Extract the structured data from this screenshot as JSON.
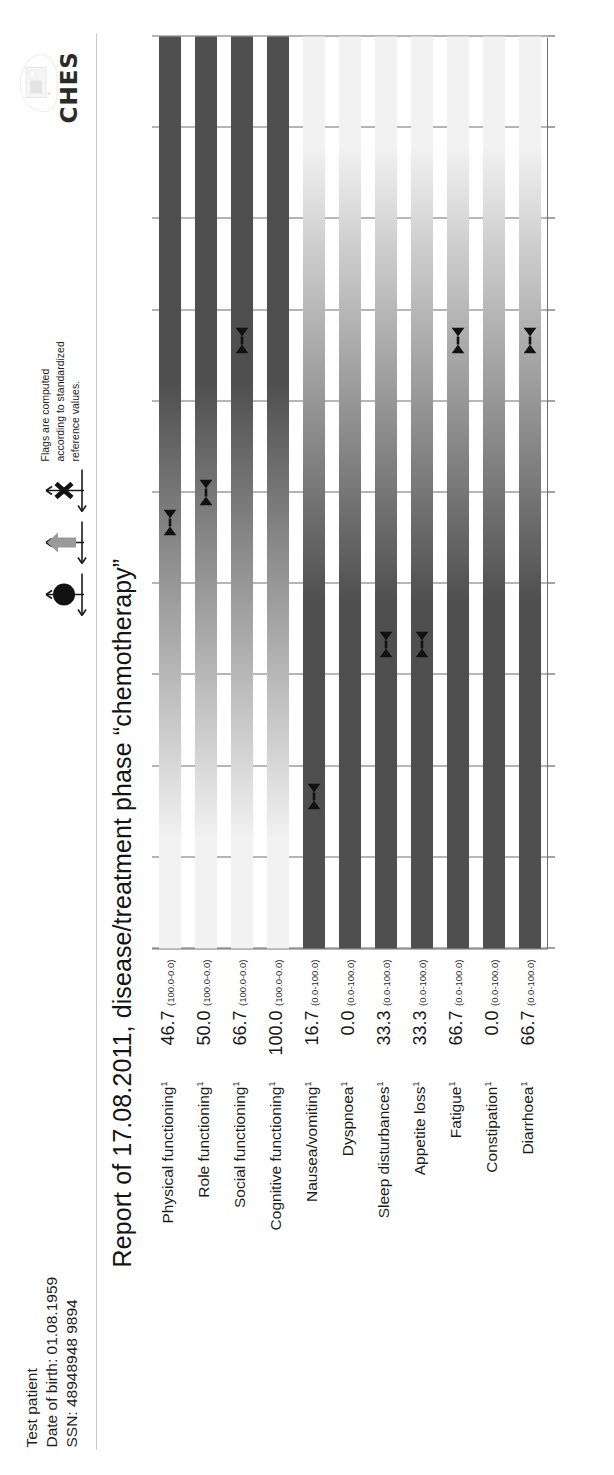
{
  "patient": {
    "name": "Test patient",
    "dob": "Date of birth: 01.08.1959",
    "ssn": "SSN: 48948948 9894"
  },
  "logo": {
    "text": "CHES"
  },
  "legend": {
    "line1": "Flags are computed",
    "line2": "according to standardized",
    "line3": "reference values.",
    "icons": [
      "circle-flag",
      "arrow-flag",
      "cross-flag"
    ]
  },
  "title": "Report of 17.08.2011, disease/treatment phase “chemotherapy”",
  "chart_data": {
    "type": "bar",
    "title": "Report of 17.08.2011, disease/treatment phase “chemotherapy”",
    "xlabel": "",
    "ylabel": "",
    "xlim": [
      0,
      100
    ],
    "grid": true,
    "legend_position": "top-right",
    "orientation": "horizontal",
    "gridlines": [
      0,
      10,
      20,
      30,
      40,
      50,
      60,
      70,
      80,
      90,
      100
    ],
    "categories": [
      "Physical functioning",
      "Role functioning",
      "Social functioning",
      "Cognitive functioning",
      "Nausea/vomiting",
      "Dyspnoea",
      "Sleep disturbances",
      "Appetite loss",
      "Fatigue",
      "Constipation",
      "Diarrhoea"
    ],
    "superscripts": [
      "1",
      "1",
      "1",
      "1",
      "1",
      "1",
      "1",
      "1",
      "1",
      "1",
      "1"
    ],
    "values": [
      46.7,
      50.0,
      66.7,
      100.0,
      16.7,
      0.0,
      33.3,
      33.3,
      66.7,
      0.0,
      66.7
    ],
    "value_labels": [
      "46.7",
      "50.0",
      "66.7",
      "100.0",
      "16.7",
      "0.0",
      "33.3",
      "33.3",
      "66.7",
      "0.0",
      "66.7"
    ],
    "ranges": [
      "(100.0-0.0)",
      "(100.0-0.0)",
      "(100.0-0.0)",
      "(100.0-0.0)",
      "(0.0-100.0)",
      "(0.0-100.0)",
      "(0.0-100.0)",
      "(0.0-100.0)",
      "(0.0-100.0)",
      "(0.0-100.0)",
      "(0.0-100.0)"
    ],
    "scale_direction": [
      "reverse",
      "reverse",
      "reverse",
      "reverse",
      "forward",
      "forward",
      "forward",
      "forward",
      "forward",
      "forward",
      "forward"
    ],
    "flags": [
      true,
      true,
      true,
      false,
      true,
      false,
      true,
      true,
      true,
      false,
      true
    ],
    "colors": {
      "bar_light": "#f2f2f2",
      "bar_dark": "#4f4f4f",
      "grid": "#6e6e6e",
      "flag": "#111111",
      "text": "#1a1a1a"
    }
  }
}
